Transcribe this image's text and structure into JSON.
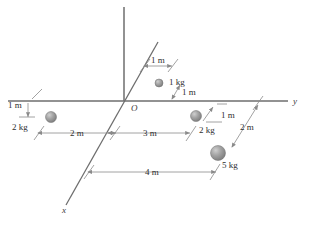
{
  "figure": {
    "background_color": "#ffffff",
    "axis_color": "#6e6e6e",
    "dimension_line_color": "#8a8a8a",
    "text_color": "#2e2e2e",
    "sphere_color": "#9a9a9a",
    "sphere_highlight_color": "#c9c9c9"
  },
  "axes": [
    {
      "id": "z",
      "label": "",
      "description": "vertical axis, unlabeled"
    },
    {
      "id": "y",
      "label": "y",
      "description": "horizontal axis to the right"
    },
    {
      "id": "x",
      "label": "x",
      "description": "diagonal axis toward lower left"
    }
  ],
  "origin": {
    "label": "O"
  },
  "masses": [
    {
      "id": "mass-left",
      "label": "2 kg",
      "value": 2,
      "unit": "kg",
      "radius": 5.5
    },
    {
      "id": "mass-top",
      "label": "1 kg",
      "value": 1,
      "unit": "kg",
      "radius": 4
    },
    {
      "id": "mass-right",
      "label": "2 kg",
      "value": 2,
      "unit": "kg",
      "radius": 5.5
    },
    {
      "id": "mass-lower-right",
      "label": "5 kg",
      "value": 5,
      "unit": "kg",
      "radius": 7.5
    }
  ],
  "dimensions": [
    {
      "id": "dim-left-1m",
      "label": "1 m",
      "value": 1,
      "unit": "m"
    },
    {
      "id": "dim-left-2m",
      "label": "2 m",
      "value": 2,
      "unit": "m"
    },
    {
      "id": "dim-top-1m",
      "label": "1 m",
      "value": 1,
      "unit": "m"
    },
    {
      "id": "dim-top-diag-1m",
      "label": "1 m",
      "value": 1,
      "unit": "m"
    },
    {
      "id": "dim-middle-3m",
      "label": "3 m",
      "value": 3,
      "unit": "m"
    },
    {
      "id": "dim-right-1m",
      "label": "1 m",
      "value": 1,
      "unit": "m"
    },
    {
      "id": "dim-right-2m",
      "label": "2 m",
      "value": 2,
      "unit": "m"
    },
    {
      "id": "dim-bottom-4m",
      "label": "4 m",
      "value": 4,
      "unit": "m"
    }
  ]
}
